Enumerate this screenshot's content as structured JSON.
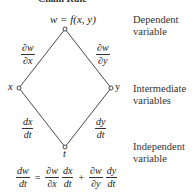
{
  "title": "Chain Rule",
  "top_equation": "w = f(x, y)",
  "nodes": {
    "w": {
      "label": "w"
    },
    "x": {
      "label": "x"
    },
    "y": {
      "label": "y"
    },
    "t": {
      "label": "t"
    }
  },
  "edges": {
    "w_x": {
      "num": "∂w",
      "den": "∂x"
    },
    "w_y": {
      "num": "∂w",
      "den": "∂y"
    },
    "x_t": {
      "num": "dx",
      "den": "dt"
    },
    "y_t": {
      "num": "dy",
      "den": "dt"
    }
  },
  "side_labels": {
    "dependent": {
      "line1": "Dependent",
      "line2": "variable"
    },
    "intermediate": {
      "line1": "Intermediate",
      "line2": "variables"
    },
    "independent": {
      "line1": "Independent",
      "line2": "variable"
    }
  },
  "formula": {
    "lhs": {
      "num": "dw",
      "den": "dt"
    },
    "eq": "=",
    "term1a": {
      "num": "∂w",
      "den": "∂x"
    },
    "term1b": {
      "num": "dx",
      "den": "dt"
    },
    "plus": "+",
    "term2a": {
      "num": "∂w",
      "den": "∂y"
    },
    "term2b": {
      "num": "dy",
      "den": "dt"
    }
  }
}
